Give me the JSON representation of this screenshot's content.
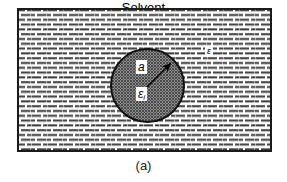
{
  "figure": {
    "caption": "(a)",
    "solvent_box": {
      "name": "solvent-medium-region",
      "hatch_pattern": "horizontal-dash-hatch",
      "border_color": "#1b1b1b",
      "fill_color": "#ffffff"
    },
    "cavity": {
      "name": "spherical-cavity",
      "fill_pattern": "fine-stipple-dots",
      "border_color": "#111111",
      "fill_color": "#d2d2d2"
    },
    "labels": {
      "cavity_radius": "a",
      "internal_dielectric_symbol": "ε",
      "internal_dielectric_subscript": "i",
      "external_dielectric_symbol": "ε",
      "solvent_line1": "Solvent",
      "solvent_line2": "medium"
    },
    "arrow": {
      "name": "radius-arrow",
      "description": "arrow from cavity center to cavity surface",
      "color": "#000000"
    }
  }
}
